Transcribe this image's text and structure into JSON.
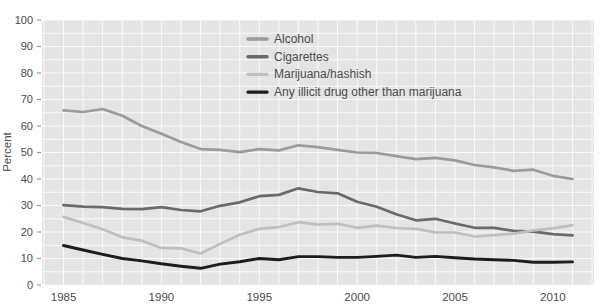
{
  "figure": {
    "background_color": "#ffffff"
  },
  "chart_data": {
    "type": "line",
    "title": "",
    "xlabel": "",
    "ylabel": "Percent",
    "xlim": [
      1983.9,
      2012.1
    ],
    "ylim": [
      0,
      100
    ],
    "x": [
      1985,
      1986,
      1987,
      1988,
      1989,
      1990,
      1991,
      1992,
      1993,
      1994,
      1995,
      1996,
      1997,
      1998,
      1999,
      2000,
      2001,
      2002,
      2003,
      2004,
      2005,
      2006,
      2007,
      2008,
      2009,
      2010,
      2011
    ],
    "x_tick_labels": [
      1985,
      1990,
      1995,
      2000,
      2005,
      2010
    ],
    "y_tick_labels": [
      0,
      10,
      20,
      30,
      40,
      50,
      60,
      70,
      80,
      90,
      100
    ],
    "y_grid_step": 5,
    "x_grid_step": 1,
    "grid": true,
    "legend_position": "top-inside",
    "panel_color": "#e4e4e4",
    "grid_color": "#fafafa",
    "tick_color": "#999999",
    "text_color": "#4a4a4a",
    "series": [
      {
        "name": "Alcohol",
        "color": "#9b9b9b",
        "values": [
          65.9,
          65.3,
          66.4,
          63.9,
          60.0,
          57.1,
          54.0,
          51.3,
          51.0,
          50.1,
          51.3,
          50.8,
          52.7,
          52.0,
          51.0,
          50.0,
          49.8,
          48.6,
          47.5,
          48.0,
          47.0,
          45.3,
          44.4,
          43.1,
          43.5,
          41.2,
          40.0
        ]
      },
      {
        "name": "Cigarettes",
        "color": "#6a6a6a",
        "values": [
          30.1,
          29.6,
          29.4,
          28.7,
          28.6,
          29.4,
          28.3,
          27.8,
          29.9,
          31.2,
          33.5,
          34.0,
          36.5,
          35.1,
          34.6,
          31.4,
          29.5,
          26.7,
          24.4,
          25.0,
          23.2,
          21.6,
          21.6,
          20.4,
          20.1,
          19.2,
          18.7
        ]
      },
      {
        "name": "Marijuana/hashish",
        "color": "#bfbfbf",
        "values": [
          25.7,
          23.4,
          21.0,
          18.0,
          16.7,
          14.0,
          13.8,
          11.9,
          15.5,
          19.0,
          21.2,
          21.9,
          23.7,
          22.8,
          23.1,
          21.6,
          22.4,
          21.5,
          21.2,
          19.9,
          19.8,
          18.3,
          18.8,
          19.4,
          20.6,
          21.4,
          22.6
        ]
      },
      {
        "name": "Any illicit drug other than marijuana",
        "color": "#1c1c1c",
        "values": [
          14.9,
          13.2,
          11.6,
          10.0,
          9.1,
          8.0,
          7.1,
          6.3,
          7.9,
          8.8,
          10.0,
          9.5,
          10.7,
          10.7,
          10.4,
          10.4,
          10.8,
          11.3,
          10.4,
          10.8,
          10.3,
          9.8,
          9.5,
          9.3,
          8.6,
          8.6,
          8.7
        ]
      }
    ]
  }
}
